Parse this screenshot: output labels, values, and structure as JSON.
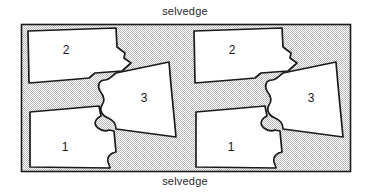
{
  "diagram": {
    "selvedge_top_label": "selvedge",
    "selvedge_bottom_label": "selvedge",
    "fabric": {
      "fill_color": "#d4d4d4",
      "border_color": "#1a1a1a",
      "x": 21,
      "y": 24,
      "width": 330,
      "height": 148
    },
    "piece_fill_color": "#ffffff",
    "piece_outline_color": "#1a1a1a",
    "pieces": [
      {
        "label": "2",
        "group": "left",
        "label_x": 66,
        "label_y": 51
      },
      {
        "label": "3",
        "group": "left",
        "label_x": 144,
        "label_y": 99
      },
      {
        "label": "1",
        "group": "left",
        "label_x": 65,
        "label_y": 148
      },
      {
        "label": "2",
        "group": "right",
        "label_x": 232,
        "label_y": 51
      },
      {
        "label": "3",
        "group": "right",
        "label_x": 311,
        "label_y": 99
      },
      {
        "label": "1",
        "group": "right",
        "label_x": 231,
        "label_y": 148
      }
    ]
  }
}
